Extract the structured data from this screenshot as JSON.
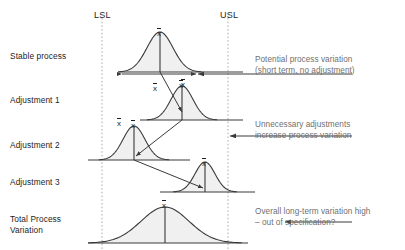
{
  "figure": {
    "spec_limits": {
      "lower_label": "LSL",
      "upper_label": "USL",
      "lower_x": 102,
      "upper_x": 228
    },
    "mean_symbol": "x",
    "colors": {
      "curve_stroke": "#3a3a3a",
      "curve_fill": "#f0f0f0",
      "axis": "#3a3a3a",
      "spec_line": "#a8a8a8",
      "arrow": "#3a3a3a",
      "note_text": "#6f6f6f",
      "label_text": "#1d1d1d",
      "background": "#ffffff"
    },
    "rows": [
      {
        "id": "stable-process",
        "label": "Stable process",
        "label_x": 10,
        "label_y": 51,
        "baseline_y": 72,
        "baseline_x1": 118,
        "baseline_x2": 243,
        "center_x": 160,
        "sigma": 13,
        "height": 40,
        "mean_label_y": 28
      },
      {
        "id": "adjustment-1",
        "label": "Adjustment 1",
        "label_x": 10,
        "label_y": 95,
        "baseline_y": 120,
        "baseline_x1": 140,
        "baseline_x2": 243,
        "center_x": 182,
        "sigma": 11,
        "height": 34,
        "mean_label_y": 80
      },
      {
        "id": "adjustment-2",
        "label": "Adjustment 2",
        "label_x": 10,
        "label_y": 140,
        "baseline_y": 160,
        "baseline_x1": 88,
        "baseline_x2": 190,
        "center_x": 134,
        "sigma": 11,
        "height": 34,
        "mean_label_y": 120
      },
      {
        "id": "adjustment-3",
        "label": "Adjustment 3",
        "label_x": 10,
        "label_y": 177,
        "baseline_y": 192,
        "baseline_x1": 160,
        "baseline_x2": 255,
        "center_x": 205,
        "sigma": 10,
        "height": 30,
        "mean_label_y": 158
      },
      {
        "id": "total-process-variation",
        "label": "Total Process\nVariation",
        "label_x": 10,
        "label_y": 214,
        "baseline_y": 243,
        "baseline_x1": 88,
        "baseline_x2": 248,
        "center_x": 165,
        "sigma": 24,
        "height": 36,
        "mean_label_y": 200
      }
    ],
    "notes": [
      {
        "id": "potential-process-variation",
        "text": "Potential process variation\n(short term, no adjustment)",
        "x": 255,
        "y": 55,
        "arrow": {
          "x1": 352,
          "y1": 74,
          "x2": 198,
          "y2": 74
        }
      },
      {
        "id": "unnecessary-adjustments",
        "text": "Unnecessary adjustments\nincrease process variation",
        "x": 255,
        "y": 120,
        "arrow": {
          "x1": 352,
          "y1": 136,
          "x2": 230,
          "y2": 136
        }
      },
      {
        "id": "overall-long-term-variation",
        "text": "Overall long-term variation high\n– out of specification?",
        "x": 255,
        "y": 207,
        "arrow": {
          "x1": 352,
          "y1": 222,
          "x2": 285,
          "y2": 222
        }
      }
    ],
    "spread_arrow": {
      "id": "short-term-spread-arrow",
      "y": 74,
      "x1": 122,
      "x2": 196
    },
    "shift_arrows": [
      {
        "id": "shift-1",
        "x1": 160,
        "y1": 72,
        "x2": 182,
        "y2": 112
      },
      {
        "id": "shift-2",
        "x1": 182,
        "y1": 120,
        "x2": 136,
        "y2": 156
      },
      {
        "id": "shift-3",
        "x1": 134,
        "y1": 160,
        "x2": 203,
        "y2": 188
      }
    ]
  }
}
